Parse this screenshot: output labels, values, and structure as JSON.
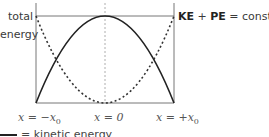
{
  "diagram": {
    "y_label_line1": "total",
    "y_label_line2": "energy",
    "equation": {
      "term1": "KE",
      "plus": " + ",
      "term2": "PE",
      "equals": " = constant"
    },
    "x_labels": {
      "left_prefix": "x = −x",
      "left_sub": "0",
      "center": "x = 0",
      "right_prefix": "x = +x",
      "right_sub": "0"
    },
    "legend": [
      {
        "style": "solid",
        "label": "= kinetic energy"
      }
    ],
    "curves": [
      {
        "name": "kinetic energy",
        "style": "solid",
        "shape": "downward parabola",
        "peak": "x = 0"
      },
      {
        "name": "potential energy",
        "style": "dotted",
        "shape": "upward parabola",
        "min": "x = 0"
      }
    ],
    "colors": {
      "line": "#222222",
      "axis": "#777777",
      "text": "#3a3a3a"
    }
  }
}
